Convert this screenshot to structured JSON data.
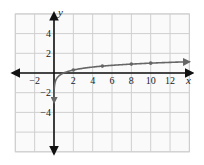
{
  "chart_data": {
    "type": "line",
    "title": "",
    "xlabel": "x",
    "ylabel": "y",
    "xlim": [
      -4,
      14
    ],
    "ylim": [
      -8,
      6
    ],
    "grid": true,
    "grid_step": 2,
    "x_tick_labels": [
      "-2",
      "2",
      "4",
      "6",
      "8",
      "10",
      "12"
    ],
    "x_ticks": [
      -2,
      2,
      4,
      6,
      8,
      10,
      12
    ],
    "y_tick_labels": [
      "4",
      "2",
      "-2",
      "-4"
    ],
    "y_ticks": [
      4,
      2,
      -2,
      -4
    ],
    "series": [
      {
        "name": "y = log x",
        "function": "log10(x)",
        "x": [
          0.05,
          0.1,
          0.2,
          0.4,
          0.7,
          1,
          2,
          5,
          8,
          10,
          14
        ],
        "values": [
          -1.3,
          -1.0,
          -0.7,
          -0.4,
          -0.15,
          0,
          0.3,
          0.7,
          0.9,
          1.0,
          1.15
        ],
        "marked_points": [
          {
            "x": 2,
            "y": 0.3
          },
          {
            "x": 5,
            "y": 0.7
          },
          {
            "x": 8,
            "y": 0.9
          },
          {
            "x": 10,
            "y": 1.0
          }
        ],
        "color": "#666666"
      }
    ],
    "asymptote": {
      "type": "vertical",
      "x": 0,
      "arrow_toward_y": -3
    },
    "colors": {
      "axis": "#111111",
      "grid": "#cfcfcf",
      "curve": "#666666"
    }
  }
}
